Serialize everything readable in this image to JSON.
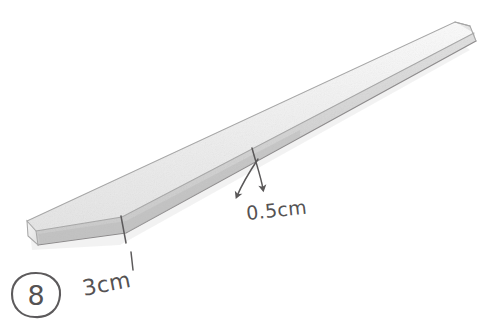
{
  "figure": {
    "background_color": "#ffffff",
    "ink_color": "#555253",
    "object": {
      "name": "strip",
      "shape": "long thin rectangular prism",
      "orientation": "diagonal, lower-left to upper-right",
      "top_face_color": "#f2f2f2",
      "side_face_color": "#dcdcdc",
      "end_face_color": "#e8e8e8",
      "edge_color": "#9a9a9a"
    },
    "labels": [
      {
        "id": "width-label",
        "text": "3cm",
        "x": 84,
        "y": 296,
        "rotation": -11,
        "font_size": 22,
        "describes": "width of the near end face of the strip",
        "leader": "short vertical tick from the lower edge of the strip"
      },
      {
        "id": "thickness-label",
        "text": "0.5cm",
        "x": 247,
        "y": 220,
        "rotation": -6,
        "font_size": 19,
        "describes": "thickness of the strip",
        "leader": "two curved arrows pointing up toward the strip edge"
      }
    ],
    "question_marker": {
      "id": "question-number",
      "text": "8",
      "cx": 36,
      "cy": 295,
      "rx": 24,
      "ry": 22,
      "font_size": 27,
      "style": "hand-drawn circle enclosing the numeral"
    },
    "arrows": [
      {
        "id": "thickness-arrow-left",
        "from_x": 258,
        "from_y": 159,
        "to_x": 238,
        "to_y": 200,
        "direction": "down-left",
        "curved": true
      },
      {
        "id": "thickness-arrow-right",
        "from_x": 252,
        "from_y": 148,
        "to_x": 263,
        "to_y": 193,
        "direction": "down",
        "curved": true
      }
    ],
    "tick_marks": [
      {
        "id": "width-tick",
        "x1": 121,
        "y1": 216,
        "x2": 126,
        "y2": 243,
        "note": "crosses the lower edge of the strip at the 3cm measurement"
      },
      {
        "id": "width-leader-dash",
        "x1": 131,
        "y1": 252,
        "x2": 133,
        "y2": 270,
        "note": "short dash between tick and the 3cm text"
      }
    ]
  }
}
